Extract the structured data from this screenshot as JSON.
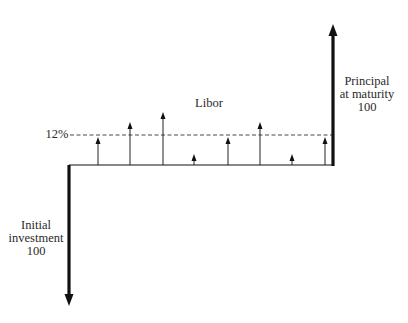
{
  "diagram": {
    "labels": {
      "rate_level": "12%",
      "libor": "Libor",
      "principal_line1": "Principal",
      "principal_line2": "at maturity",
      "principal_value": "100",
      "initial_line1": "Initial",
      "initial_line2": "investment",
      "initial_value": "100"
    },
    "colors": {
      "ink": "#111111",
      "text": "#2a2a2a",
      "background": "#ffffff"
    },
    "coupon_arrows": [
      {
        "period": 1,
        "relative_to_12pct": "below"
      },
      {
        "period": 2,
        "relative_to_12pct": "above"
      },
      {
        "period": 3,
        "relative_to_12pct": "above"
      },
      {
        "period": 4,
        "relative_to_12pct": "below"
      },
      {
        "period": 5,
        "relative_to_12pct": "below"
      },
      {
        "period": 6,
        "relative_to_12pct": "above"
      },
      {
        "period": 7,
        "relative_to_12pct": "below"
      },
      {
        "period": 8,
        "relative_to_12pct": "below"
      }
    ]
  }
}
